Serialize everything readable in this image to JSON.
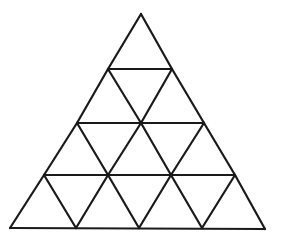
{
  "diagram": {
    "type": "triangular-grid",
    "rows": 4,
    "small_triangle_count": 16,
    "stroke_color": "#1a1a1a",
    "background_color": "#ffffff",
    "vertices": {
      "row0": [
        [
          141,
          14
        ]
      ],
      "row1": [
        [
          108,
          69
        ],
        [
          172,
          69
        ]
      ],
      "row2": [
        [
          77,
          123
        ],
        [
          141,
          123
        ],
        [
          204,
          123
        ]
      ],
      "row3": [
        [
          44,
          175
        ],
        [
          108,
          175
        ],
        [
          171,
          175
        ],
        [
          235,
          175
        ]
      ],
      "row4": [
        [
          10,
          228
        ],
        [
          76,
          228
        ],
        [
          139,
          228
        ],
        [
          202,
          228
        ],
        [
          265,
          229
        ]
      ]
    }
  }
}
